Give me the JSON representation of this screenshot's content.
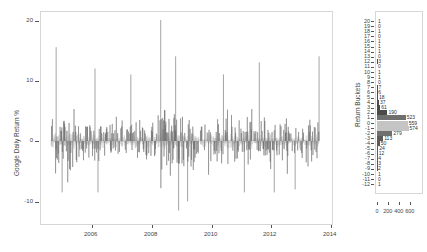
{
  "chart_data": [
    {
      "type": "line",
      "title": "",
      "xlabel": "",
      "ylabel": "Google Daily Return %",
      "x_ticks": [
        "2006",
        "2008",
        "2010",
        "2012",
        "2014"
      ],
      "y_ticks": [
        "-10",
        "0",
        "10",
        "20"
      ],
      "xlim": [
        2004.6,
        2014.0
      ],
      "ylim": [
        -13,
        22
      ],
      "grid": false,
      "series_description": "Daily returns drawn as vertical lines from 0; dark gray for large moves, light gray near zero",
      "notable_points": [
        {
          "x": 2004.8,
          "y": 15.5
        },
        {
          "x": 2005.0,
          "y": -8.5
        },
        {
          "x": 2006.1,
          "y": 12
        },
        {
          "x": 2006.2,
          "y": -8.5
        },
        {
          "x": 2007.3,
          "y": 11
        },
        {
          "x": 2008.3,
          "y": 20
        },
        {
          "x": 2008.8,
          "y": 14
        },
        {
          "x": 2008.9,
          "y": -11.5
        },
        {
          "x": 2009.2,
          "y": -10
        },
        {
          "x": 2010.4,
          "y": 11
        },
        {
          "x": 2011.1,
          "y": -8.5
        },
        {
          "x": 2011.6,
          "y": 13
        },
        {
          "x": 2012.1,
          "y": -8.5
        },
        {
          "x": 2012.8,
          "y": -8
        },
        {
          "x": 2013.6,
          "y": 14
        }
      ],
      "colors": {
        "major": "#666666",
        "minor": "#b0b0b0"
      }
    },
    {
      "type": "bar",
      "orientation": "horizontal",
      "title": "",
      "xlabel": "",
      "ylabel": "Return Buckets",
      "x_ticks": [
        "0",
        "200",
        "400",
        "600"
      ],
      "categories": [
        "20",
        "19",
        "18",
        "17",
        "16",
        "15",
        "14",
        "13",
        "12",
        "11",
        "10",
        "9",
        "8",
        "7",
        "6",
        "5",
        "4",
        "3",
        "2",
        "1",
        "0",
        "-1",
        "-2",
        "-3",
        "-4",
        "-5",
        "-6",
        "-7",
        "-8",
        "-9",
        "-10",
        "-11",
        "-12"
      ],
      "values": [
        1,
        0,
        1,
        0,
        1,
        1,
        1,
        0,
        3,
        0,
        1,
        1,
        0,
        7,
        6,
        18,
        37,
        61,
        190,
        523,
        559,
        574,
        279,
        113,
        50,
        24,
        12,
        4,
        3,
        2,
        1,
        0,
        1
      ],
      "colors": {
        "positive": "#555555",
        "zero": "#c4c4c4",
        "negative": "#555555"
      }
    }
  ],
  "main_chart": {
    "ylabel": "Google Daily Return %",
    "y_ticks": [
      {
        "label": "20",
        "y": 21
      },
      {
        "label": "10",
        "y": 81
      },
      {
        "label": "0",
        "y": 141
      },
      {
        "label": "-10",
        "y": 202
      }
    ],
    "x_ticks": [
      {
        "label": "2006",
        "x": 92
      },
      {
        "label": "2008",
        "x": 152
      },
      {
        "label": "2010",
        "x": 212
      },
      {
        "label": "2012",
        "x": 271
      },
      {
        "label": "2014",
        "x": 331
      }
    ]
  },
  "histogram": {
    "ylabel": "Return Buckets",
    "x_ticks": [
      {
        "label": "0",
        "x": 377
      },
      {
        "label": "200",
        "x": 388
      },
      {
        "label": "400",
        "x": 399
      },
      {
        "label": "600",
        "x": 410
      }
    ]
  }
}
